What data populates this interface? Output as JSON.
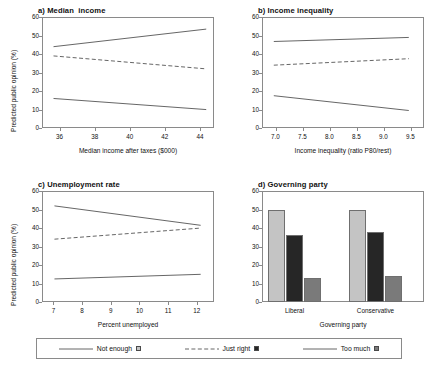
{
  "figure": {
    "width": 436,
    "height": 370,
    "shared_ylabel": "Predicted public opinion (%)",
    "ylim": [
      0,
      60
    ],
    "yticks": [
      "0",
      "10",
      "20",
      "30",
      "40",
      "50",
      "60"
    ]
  },
  "colors": {
    "not_enough": "#c4c4c4",
    "just_right": "#262626",
    "too_much": "#7a7a7a",
    "axis": "#8a8a8a",
    "line": "#555555",
    "text": "#111111"
  },
  "legend": {
    "items": [
      {
        "label": "Not enough",
        "style": "solid",
        "swatch": "#c4c4c4"
      },
      {
        "label": "Just right",
        "style": "dashed",
        "swatch": "#262626"
      },
      {
        "label": "Too much",
        "style": "solid",
        "swatch": "#7a7a7a"
      }
    ]
  },
  "chart_data": [
    {
      "type": "line",
      "panel": "a",
      "title": "a) Median  income",
      "xlabel": "Median income after taxes ($000)",
      "ylabel": "Predicted public opinion (%)",
      "xlim": [
        35.0,
        44.8
      ],
      "ylim": [
        0,
        60
      ],
      "xticks": [
        "36",
        "38",
        "40",
        "42",
        "44"
      ],
      "xtick_values": [
        36,
        38,
        40,
        42,
        44
      ],
      "yticks": [
        "0",
        "10",
        "20",
        "30",
        "40",
        "50",
        "60"
      ],
      "grid": false,
      "series": [
        {
          "name": "Not enough",
          "style": "solid",
          "x": [
            35.6,
            44.3
          ],
          "values": [
            44.5,
            54.0
          ]
        },
        {
          "name": "Just right",
          "style": "dashed",
          "x": [
            35.6,
            44.3
          ],
          "values": [
            39.5,
            32.5
          ]
        },
        {
          "name": "Too much",
          "style": "solid",
          "x": [
            35.6,
            44.3
          ],
          "values": [
            16.5,
            10.5
          ]
        }
      ]
    },
    {
      "type": "line",
      "panel": "b",
      "title": "b) Income inequality",
      "xlabel": "Income inequality (ratio P80/rest)",
      "ylabel": "Predicted public opinion (%)",
      "xlim": [
        6.75,
        9.75
      ],
      "ylim": [
        0,
        60
      ],
      "xticks": [
        "7.0",
        "7.5",
        "8.0",
        "8.5",
        "9.0",
        "9.5"
      ],
      "xtick_values": [
        7.0,
        7.5,
        8.0,
        8.5,
        9.0,
        9.5
      ],
      "yticks": [
        "0",
        "10",
        "20",
        "30",
        "40",
        "50",
        "60"
      ],
      "grid": false,
      "series": [
        {
          "name": "Not enough",
          "style": "solid",
          "x": [
            6.95,
            9.45
          ],
          "values": [
            47.3,
            49.5
          ]
        },
        {
          "name": "Just right",
          "style": "dashed",
          "x": [
            6.95,
            9.45
          ],
          "values": [
            34.5,
            38.0
          ]
        },
        {
          "name": "Too much",
          "style": "solid",
          "x": [
            6.95,
            9.45
          ],
          "values": [
            18.0,
            10.0
          ]
        }
      ]
    },
    {
      "type": "line",
      "panel": "c",
      "title": "c) Unemployment rate",
      "xlabel": "Percent unemployed",
      "ylabel": "Predicted public opinion (%)",
      "xlim": [
        6.6,
        12.6
      ],
      "ylim": [
        0,
        60
      ],
      "xticks": [
        "7",
        "8",
        "9",
        "10",
        "11",
        "12"
      ],
      "xtick_values": [
        7,
        8,
        9,
        10,
        11,
        12
      ],
      "yticks": [
        "0",
        "10",
        "20",
        "30",
        "40",
        "50",
        "60"
      ],
      "grid": false,
      "series": [
        {
          "name": "Not enough",
          "style": "solid",
          "x": [
            7.0,
            12.1
          ],
          "values": [
            52.5,
            42.0
          ]
        },
        {
          "name": "Just right",
          "style": "dashed",
          "x": [
            7.0,
            12.1
          ],
          "values": [
            34.5,
            40.5
          ]
        },
        {
          "name": "Too much",
          "style": "solid",
          "x": [
            7.0,
            12.1
          ],
          "values": [
            13.0,
            15.5
          ]
        }
      ]
    },
    {
      "type": "bar",
      "panel": "d",
      "title": "d) Governing party",
      "xlabel": "Governing party",
      "ylabel": "Predicted public opinion (%)",
      "ylim": [
        0,
        60
      ],
      "yticks": [
        "0",
        "10",
        "20",
        "30",
        "40",
        "50",
        "60"
      ],
      "categories": [
        "Liberal",
        "Conservative"
      ],
      "grid": false,
      "series": [
        {
          "name": "Not enough",
          "color": "#c4c4c4",
          "values": [
            49.5,
            49.5
          ]
        },
        {
          "name": "Just right",
          "color": "#262626",
          "values": [
            36.0,
            38.0
          ]
        },
        {
          "name": "Too much",
          "color": "#7a7a7a",
          "values": [
            12.8,
            14.2
          ]
        }
      ]
    }
  ]
}
